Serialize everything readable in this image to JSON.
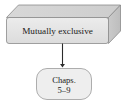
{
  "diagram": {
    "background_color": "#ffffff",
    "nodes": [
      {
        "id": "mutually-exclusive-box",
        "shape": "cuboid",
        "label": "Mutually exclusive",
        "front_fill": "#e4e4e4",
        "top_fill": "#d2d2d2",
        "side_fill": "#c4c4c4",
        "stroke": "#8a8a8a",
        "text_color": "#1a1a1a"
      },
      {
        "id": "chapters-box",
        "shape": "rounded-rectangle",
        "label_line1": "Chaps.",
        "label_line2": "5–9",
        "fill": "#eeeeee",
        "stroke": "#9a9a9a",
        "text_color": "#1a1a1a"
      }
    ],
    "edges": [
      {
        "id": "flow-arrow",
        "from": "mutually-exclusive-box",
        "to": "chapters-box",
        "direction": "down",
        "style": "solid",
        "arrowhead": "filled-triangle",
        "color": "#2b2b2b"
      }
    ]
  }
}
